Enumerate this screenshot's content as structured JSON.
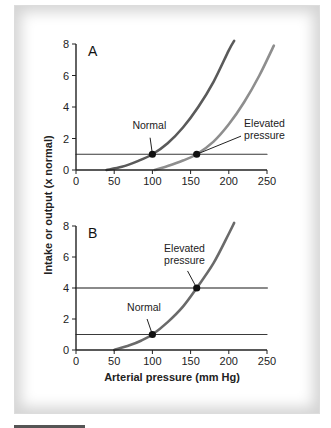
{
  "chart_data": [
    {
      "type": "line",
      "panel": "A",
      "title": "A",
      "xlabel": "Arterial pressure (mm Hg)",
      "ylabel": "Intake or output (x normal)",
      "xlim": [
        0,
        250
      ],
      "ylim": [
        0,
        8
      ],
      "xticks": [
        0,
        50,
        100,
        150,
        200,
        250
      ],
      "yticks": [
        0,
        2,
        4,
        6,
        8
      ],
      "grid": false,
      "series": [
        {
          "name": "Renal output curve (normal)",
          "color": "#5a5a5a",
          "width": 2.6,
          "x": [
            40,
            60,
            80,
            100,
            120,
            140,
            160,
            180,
            200,
            207
          ],
          "y": [
            0,
            0.2,
            0.55,
            1.0,
            1.7,
            2.7,
            4.0,
            5.6,
            7.6,
            8.2
          ]
        },
        {
          "name": "Renal output curve (elevated pressure)",
          "color": "#8e8e8e",
          "width": 2.6,
          "x": [
            103,
            120,
            140,
            158,
            180,
            200,
            220,
            240,
            259
          ],
          "y": [
            0,
            0.25,
            0.6,
            1.0,
            1.8,
            2.9,
            4.3,
            6.0,
            7.9
          ]
        },
        {
          "name": "Intake level",
          "color": "#3a3a3a",
          "width": 1.2,
          "x": [
            0,
            250
          ],
          "y": [
            1,
            1
          ]
        }
      ],
      "points": [
        {
          "label": "Normal",
          "x": 100,
          "y": 1
        },
        {
          "label": "Elevated pressure",
          "x": 158,
          "y": 1
        }
      ],
      "annotations": [
        {
          "lines": [
            "Normal"
          ],
          "text_x": 96,
          "text_y": 2.6,
          "anchor": "middle",
          "leader_from": [
            97,
            2.05
          ],
          "leader_to": [
            100,
            1
          ]
        },
        {
          "lines": [
            "Elevated",
            "pressure"
          ],
          "text_x": 220,
          "text_y": 2.7,
          "anchor": "start",
          "leader_from": [
            216,
            2.15
          ],
          "leader_to": [
            158,
            1
          ]
        }
      ]
    },
    {
      "type": "line",
      "panel": "B",
      "title": "B",
      "xlabel": "Arterial pressure (mm Hg)",
      "ylabel": "Intake or output (x normal)",
      "xlim": [
        0,
        250
      ],
      "ylim": [
        0,
        8
      ],
      "xticks": [
        0,
        50,
        100,
        150,
        200,
        250
      ],
      "yticks": [
        0,
        2,
        4,
        6,
        8
      ],
      "grid": false,
      "series": [
        {
          "name": "Renal output curve",
          "color": "#6a6a6a",
          "width": 2.6,
          "x": [
            50,
            70,
            85,
            100,
            120,
            140,
            158,
            180,
            200,
            207
          ],
          "y": [
            0,
            0.3,
            0.6,
            1.0,
            1.8,
            2.8,
            4.0,
            5.6,
            7.5,
            8.2
          ]
        },
        {
          "name": "Normal intake",
          "color": "#3a3a3a",
          "width": 1.2,
          "x": [
            0,
            250
          ],
          "y": [
            1,
            1
          ]
        },
        {
          "name": "Elevated intake",
          "color": "#8a8a8a",
          "width": 2.2,
          "x": [
            0,
            250
          ],
          "y": [
            4,
            4
          ]
        }
      ],
      "points": [
        {
          "label": "Normal",
          "x": 100,
          "y": 1
        },
        {
          "label": "Elevated pressure",
          "x": 158,
          "y": 4
        }
      ],
      "annotations": [
        {
          "lines": [
            "Normal"
          ],
          "text_x": 89,
          "text_y": 2.5,
          "anchor": "middle",
          "leader_from": [
            93,
            2.0
          ],
          "leader_to": [
            100,
            1
          ]
        },
        {
          "lines": [
            "Elevated",
            "pressure"
          ],
          "text_x": 142,
          "text_y": 6.3,
          "anchor": "middle",
          "leader_from": [
            146,
            5.1
          ],
          "leader_to": [
            158,
            4
          ]
        }
      ]
    }
  ],
  "labels": {
    "panel_a": "A",
    "panel_b": "B",
    "y_axis_title": "Intake or output (x normal)",
    "x_axis_title": "Arterial pressure (mm Hg)"
  }
}
